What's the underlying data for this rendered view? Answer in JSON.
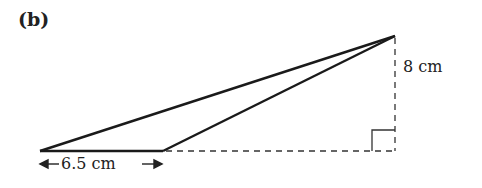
{
  "figure": {
    "part_label": "(b)",
    "height_label": "8 cm",
    "base_label": "6.5 cm",
    "colors": {
      "stroke": "#1a1a1a",
      "text": "#222222"
    },
    "shape": "obtuse triangle with external perpendicular height"
  }
}
